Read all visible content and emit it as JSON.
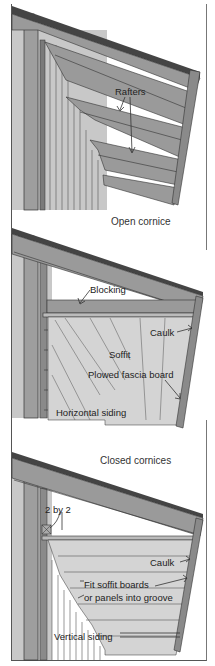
{
  "figure": {
    "panels": [
      {
        "id": "open-cornice",
        "caption": "Open cornice",
        "labels": [
          {
            "text": "Rafters",
            "x": 115,
            "y": 87
          }
        ]
      },
      {
        "id": "closed-cornice-horizontal",
        "labels": [
          {
            "text": "Blocking",
            "x": 90,
            "y": 285
          },
          {
            "text": "Caulk",
            "x": 150,
            "y": 328
          },
          {
            "text": "Soffit",
            "x": 109,
            "y": 350
          },
          {
            "text": "Plowed fascia board",
            "x": 88,
            "y": 370
          },
          {
            "text": "Horizontal siding",
            "x": 56,
            "y": 408
          }
        ]
      },
      {
        "id": "closed-cornice-vertical",
        "caption": "Closed cornices",
        "labels": [
          {
            "text": "2 by 2",
            "x": 45,
            "y": 505
          },
          {
            "text": "Caulk",
            "x": 150,
            "y": 558
          },
          {
            "text": "Fit soffit boards",
            "x": 84,
            "y": 580
          },
          {
            "text": "or panels into groove",
            "x": 84,
            "y": 593
          },
          {
            "text": "Vertical siding",
            "x": 54,
            "y": 632
          }
        ]
      }
    ],
    "colors": {
      "background": "#ffffff",
      "frame": "#555555",
      "wood_fill": "#9a9a9a",
      "wall_fill": "#c4c4c4",
      "soffit_fill": "#d2d2d2",
      "line": "#333333"
    }
  }
}
